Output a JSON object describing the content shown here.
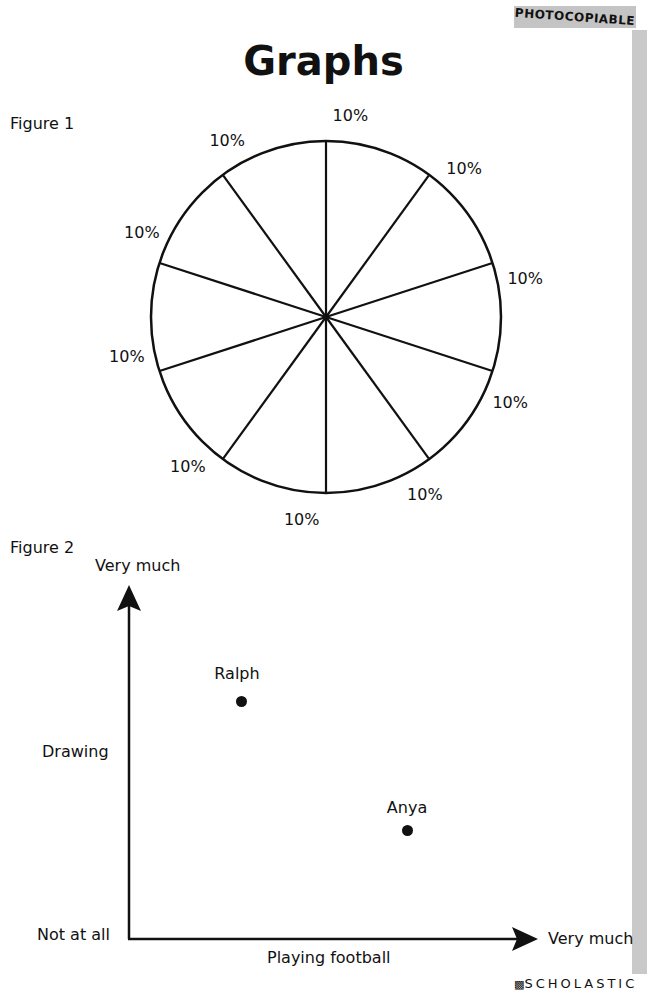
{
  "badge": "PHOTOCOPIABLE",
  "title": "Graphs",
  "publisher": "SCHOLASTIC",
  "figure1": {
    "label": "Figure 1",
    "slice_labels": [
      "10%",
      "10%",
      "10%",
      "10%",
      "10%",
      "10%",
      "10%",
      "10%",
      "10%",
      "10%"
    ]
  },
  "figure2": {
    "label": "Figure 2",
    "y_top_label": "Very much",
    "y_axis_label": "Drawing",
    "origin_label": "Not at all",
    "x_axis_label": "Playing football",
    "x_right_label": "Very much",
    "points": [
      {
        "name": "Ralph"
      },
      {
        "name": "Anya"
      }
    ]
  },
  "chart_data": [
    {
      "type": "pie",
      "title": "Figure 1",
      "categories": [
        "Slice 1",
        "Slice 2",
        "Slice 3",
        "Slice 4",
        "Slice 5",
        "Slice 6",
        "Slice 7",
        "Slice 8",
        "Slice 9",
        "Slice 10"
      ],
      "values": [
        10,
        10,
        10,
        10,
        10,
        10,
        10,
        10,
        10,
        10
      ],
      "labels": [
        "10%",
        "10%",
        "10%",
        "10%",
        "10%",
        "10%",
        "10%",
        "10%",
        "10%",
        "10%"
      ],
      "legend": "none"
    },
    {
      "type": "scatter",
      "title": "Figure 2",
      "xlabel": "Playing football",
      "ylabel": "Drawing",
      "x_range_labels": [
        "Not at all",
        "Very much"
      ],
      "y_range_labels": [
        "Not at all",
        "Very much"
      ],
      "xlim": [
        0,
        1
      ],
      "ylim": [
        0,
        1
      ],
      "grid": false,
      "series": [
        {
          "name": "Ralph",
          "x": 0.28,
          "y": 0.69
        },
        {
          "name": "Anya",
          "x": 0.71,
          "y": 0.33
        }
      ]
    }
  ]
}
